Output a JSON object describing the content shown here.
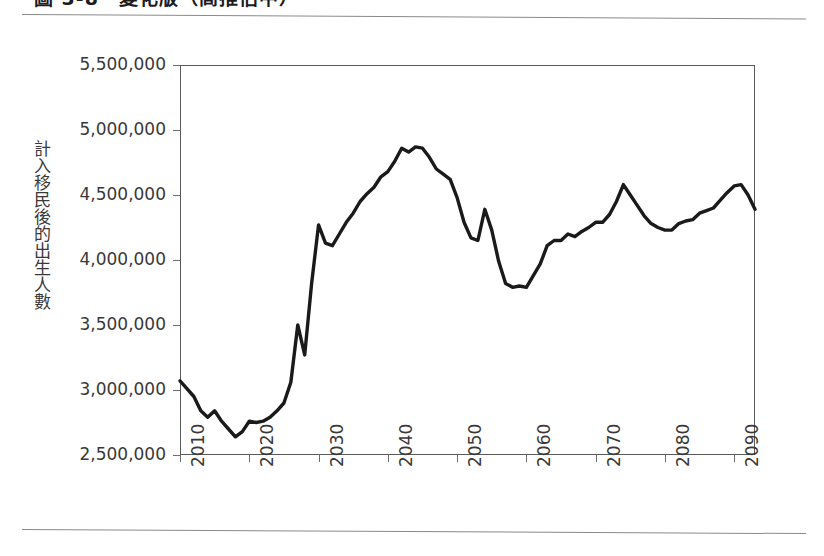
{
  "figure": {
    "caption": "圖 3-8　變化版（高推估中）",
    "y_axis_title": "計入移民後的出生人數"
  },
  "chart_data": {
    "type": "line",
    "title": "",
    "xlabel": "",
    "ylabel": "計入移民後的出生人數",
    "xlim": [
      2010,
      2093
    ],
    "ylim": [
      2500000,
      5500000
    ],
    "grid": true,
    "legend": "none",
    "line_color": "#1a1a1a",
    "gridline_color": "#c9c9c9",
    "axis_color": "#5a5a5a",
    "y_ticks": [
      2500000,
      3000000,
      3500000,
      4000000,
      4500000,
      5000000,
      5500000
    ],
    "y_tick_labels": [
      "2,500,000",
      "3,000,000",
      "3,500,000",
      "4,000,000",
      "4,500,000",
      "5,000,000",
      "5,500,000"
    ],
    "x_ticks": [
      2010,
      2020,
      2030,
      2040,
      2050,
      2060,
      2070,
      2080,
      2090
    ],
    "x_tick_labels": [
      "2010",
      "2020",
      "2030",
      "2040",
      "2050",
      "2060",
      "2070",
      "2080",
      "2090"
    ],
    "series": [
      {
        "name": "計入移民後的出生人數",
        "x": [
          2010,
          2011,
          2012,
          2013,
          2014,
          2015,
          2016,
          2017,
          2018,
          2019,
          2020,
          2021,
          2022,
          2023,
          2024,
          2025,
          2026,
          2027,
          2028,
          2029,
          2030,
          2031,
          2032,
          2033,
          2034,
          2035,
          2036,
          2037,
          2038,
          2039,
          2040,
          2041,
          2042,
          2043,
          2044,
          2045,
          2046,
          2047,
          2048,
          2049,
          2050,
          2051,
          2052,
          2053,
          2054,
          2055,
          2056,
          2057,
          2058,
          2059,
          2060,
          2061,
          2062,
          2063,
          2064,
          2065,
          2066,
          2067,
          2068,
          2069,
          2070,
          2071,
          2072,
          2073,
          2074,
          2075,
          2076,
          2077,
          2078,
          2079,
          2080,
          2081,
          2082,
          2083,
          2084,
          2085,
          2086,
          2087,
          2088,
          2089,
          2090,
          2091,
          2092,
          2093
        ],
        "values": [
          3070000,
          3010000,
          2950000,
          2840000,
          2790000,
          2840000,
          2760000,
          2700000,
          2640000,
          2680000,
          2760000,
          2750000,
          2760000,
          2790000,
          2840000,
          2900000,
          3060000,
          3500000,
          3270000,
          3820000,
          4270000,
          4130000,
          4110000,
          4200000,
          4290000,
          4360000,
          4450000,
          4510000,
          4560000,
          4640000,
          4680000,
          4760000,
          4860000,
          4830000,
          4870000,
          4860000,
          4790000,
          4700000,
          4660000,
          4620000,
          4480000,
          4290000,
          4170000,
          4150000,
          4390000,
          4230000,
          3990000,
          3820000,
          3790000,
          3800000,
          3790000,
          3880000,
          3970000,
          4110000,
          4150000,
          4150000,
          4200000,
          4180000,
          4220000,
          4250000,
          4290000,
          4290000,
          4350000,
          4450000,
          4580000,
          4500000,
          4420000,
          4340000,
          4280000,
          4250000,
          4230000,
          4230000,
          4280000,
          4300000,
          4310000,
          4360000,
          4380000,
          4400000,
          4460000,
          4520000,
          4570000,
          4580000,
          4500000,
          4390000
        ]
      }
    ]
  }
}
